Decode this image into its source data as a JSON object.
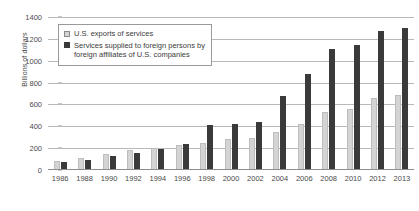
{
  "chart_data": {
    "type": "bar",
    "title": "",
    "xlabel": "",
    "ylabel": "Billions of dollars",
    "ylim": [
      0,
      1400
    ],
    "ytick_step": 200,
    "yticks": [
      0,
      200,
      400,
      600,
      800,
      1000,
      1200,
      1400
    ],
    "grid": true,
    "legend_position": "top-left",
    "categories": [
      "1986",
      "1988",
      "1990",
      "1992",
      "1994",
      "1996",
      "1998",
      "2000",
      "2002",
      "2004",
      "2006",
      "2008",
      "2010",
      "2012",
      "2013"
    ],
    "series": [
      {
        "name": "U.S. exports of services",
        "color": "#d4d4d4",
        "values": [
          85,
          110,
          150,
          180,
          200,
          225,
          245,
          280,
          290,
          345,
          420,
          535,
          560,
          655,
          690
        ]
      },
      {
        "name": "Services supplied to foreign persons by\nforeign affiliates of U.S. companies",
        "color": "#3a3a3a",
        "values": [
          75,
          95,
          125,
          160,
          190,
          240,
          410,
          420,
          440,
          680,
          880,
          1110,
          1145,
          1270,
          1300
        ]
      }
    ]
  },
  "legend": {
    "items": [
      {
        "label": "U.S. exports of services",
        "swatch": "light"
      },
      {
        "label": "Services supplied to foreign persons by\nforeign affiliates of U.S. companies",
        "swatch": "dark"
      }
    ]
  },
  "colors": {
    "series_light": "#d4d4d4",
    "series_dark": "#3a3a3a",
    "gridline": "#b9b9b9",
    "axis": "#8d8d8d",
    "text": "#3b3b3b",
    "background": "#ffffff"
  }
}
